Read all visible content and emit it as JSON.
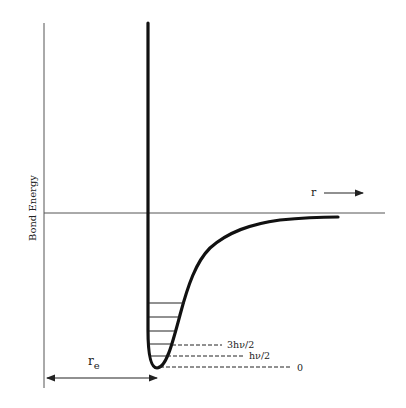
{
  "diagram": {
    "y_axis_label": "Bond Energy",
    "x_axis_label": "r",
    "distance_label": "r",
    "distance_subscript": "e",
    "energy_levels": [
      {
        "label": "3hν/2"
      },
      {
        "label": "hν/2"
      },
      {
        "label": "0"
      }
    ],
    "colors": {
      "curve": "#111111",
      "axis": "#555555",
      "text": "#222222"
    }
  }
}
